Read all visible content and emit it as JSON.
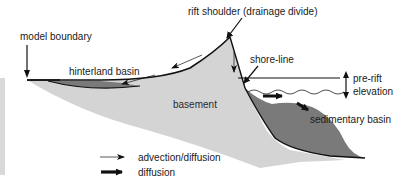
{
  "diagram": {
    "title": "",
    "labels": {
      "model_boundary": "model boundary",
      "rift_shoulder": "rift shoulder (drainage divide)",
      "shore_line": "shore-line",
      "hinterland_basin": "hinterland basin",
      "basement": "basement",
      "pre_rift": "pre-rift",
      "elevation": "elevation",
      "sedimentary_basin": "sedimentary basin"
    },
    "legend": [
      {
        "label": "advection/diffusion",
        "style": "thin-arrow"
      },
      {
        "label": "diffusion",
        "style": "thick-arrow"
      }
    ],
    "colors": {
      "basement_fill": "#d4d4d4",
      "basin_fill": "#7a7a7a",
      "outline": "#111111",
      "side_strip": "#d9d9d9"
    }
  }
}
